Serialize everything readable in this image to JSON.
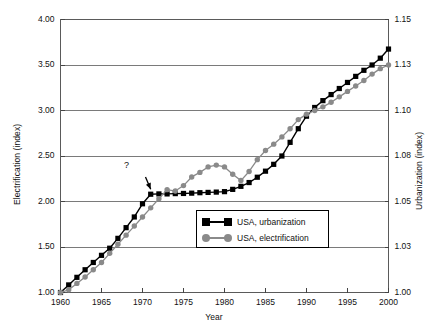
{
  "chart_data": {
    "type": "line",
    "title": "",
    "xlabel": "Year",
    "ylabel": "Electrification (index)",
    "ylabel_right": "Urbanization (index)",
    "xlim": [
      1960,
      2000
    ],
    "ylim": [
      1.0,
      4.0
    ],
    "ylim_right": [
      1.0,
      1.15
    ],
    "grid": true,
    "legend_position": "bottom-center-inside",
    "xticks": [
      1960,
      1965,
      1970,
      1975,
      1980,
      1985,
      1990,
      1995,
      2000
    ],
    "xtick_labels": [
      "1960",
      "1965",
      "1970",
      "1975",
      "1980",
      "1985",
      "1990",
      "1995",
      "2000"
    ],
    "yticks_left": [
      1.0,
      1.5,
      2.0,
      2.5,
      3.0,
      3.5,
      4.0
    ],
    "ytick_labels_left": [
      "1.00",
      "1.50",
      "2.00",
      "2.50",
      "3.00",
      "3.50",
      "4.00"
    ],
    "yticks_right": [
      1.0,
      1.03,
      1.05,
      1.08,
      1.1,
      1.13,
      1.15
    ],
    "ytick_labels_right": [
      "1.00",
      "1.03",
      "1.05",
      "1.08",
      "1.10",
      "1.13",
      "1.15"
    ],
    "annotations": [
      {
        "text": "?",
        "x": 1970.0,
        "y_right": 1.0675,
        "points_to_x": 1971.0,
        "points_to_y_right": 1.0555
      }
    ],
    "series": [
      {
        "name": "USA, urbanization",
        "axis": "right",
        "color": "#000000",
        "marker": "square",
        "x": [
          1960,
          1961,
          1962,
          1963,
          1964,
          1965,
          1966,
          1967,
          1968,
          1969,
          1970,
          1971,
          1972,
          1973,
          1974,
          1975,
          1976,
          1977,
          1978,
          1979,
          1980,
          1981,
          1982,
          1983,
          1984,
          1985,
          1986,
          1987,
          1988,
          1989,
          1990,
          1991,
          1992,
          1993,
          1994,
          1995,
          1996,
          1997,
          1998,
          1999,
          2000
        ],
        "values": [
          1.0,
          1.005,
          1.01,
          1.015,
          1.0198,
          1.0245,
          1.0292,
          1.0338,
          1.0385,
          1.0432,
          1.049,
          1.0548,
          1.055,
          1.055,
          1.0552,
          1.0553,
          1.0555,
          1.0558,
          1.056,
          1.0562,
          1.0565,
          1.058,
          1.06,
          1.0625,
          1.066,
          1.07,
          1.0745,
          1.08,
          1.086,
          1.092,
          1.0975,
          1.102,
          1.1065,
          1.1105,
          1.1145,
          1.1185,
          1.1225,
          1.1265,
          1.13,
          1.133,
          1.137
        ]
      },
      {
        "name": "USA, electrification",
        "axis": "left",
        "color": "#8a8a8a",
        "marker": "circle",
        "x": [
          1960,
          1961,
          1962,
          1963,
          1964,
          1965,
          1966,
          1967,
          1968,
          1969,
          1970,
          1971,
          1972,
          1973,
          1974,
          1975,
          1976,
          1977,
          1978,
          1979,
          1980,
          1981,
          1982,
          1983,
          1984,
          1985,
          1986,
          1987,
          1988,
          1989,
          1990,
          1991,
          1992,
          1993,
          1994,
          1995,
          1996,
          1997,
          1998,
          1999,
          2000
        ],
        "values": [
          1.0,
          1.03,
          1.1,
          1.17,
          1.25,
          1.33,
          1.43,
          1.53,
          1.63,
          1.73,
          1.83,
          1.93,
          2.03,
          2.13,
          2.115,
          2.175,
          2.27,
          2.32,
          2.38,
          2.4,
          2.38,
          2.3,
          2.23,
          2.33,
          2.46,
          2.56,
          2.63,
          2.71,
          2.8,
          2.9,
          2.96,
          3.0,
          3.04,
          3.09,
          3.15,
          3.21,
          3.27,
          3.33,
          3.4,
          3.46,
          3.5
        ]
      }
    ]
  },
  "axis_titles": {
    "left": "Electrification (index)",
    "right": "Urbanization (index)",
    "bottom": "Year"
  },
  "legend": {
    "items": [
      {
        "label": "USA, urbanization"
      },
      {
        "label": "USA, electrification"
      }
    ]
  },
  "annotation": {
    "question_mark": "?"
  }
}
